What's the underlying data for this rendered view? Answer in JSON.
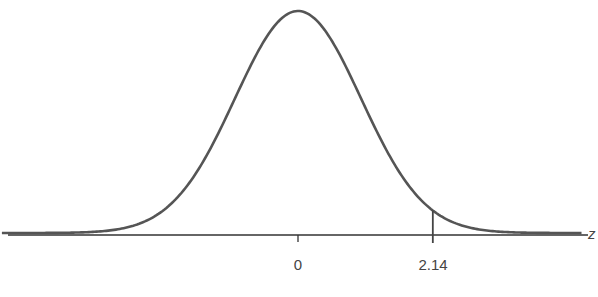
{
  "chart_data": {
    "type": "line",
    "title": "",
    "xlabel": "z",
    "ylabel": "",
    "distribution": {
      "name": "standard normal",
      "mean": 0,
      "sd": 1
    },
    "x_range": [
      -4.7,
      4.5
    ],
    "tick_labels": [
      "0",
      "2.14"
    ],
    "ticks": [
      0,
      2.14
    ],
    "markers": [
      {
        "x": 2.14,
        "label": "2.14",
        "style": "vertical line from axis to curve"
      }
    ],
    "grid": false,
    "legend": null
  },
  "labels": {
    "tick_0": "0",
    "tick_214": "2.14",
    "axis_variable": "z"
  },
  "style": {
    "curve_color": "#555555",
    "axis_color": "#333333",
    "marker_color": "#444444"
  }
}
